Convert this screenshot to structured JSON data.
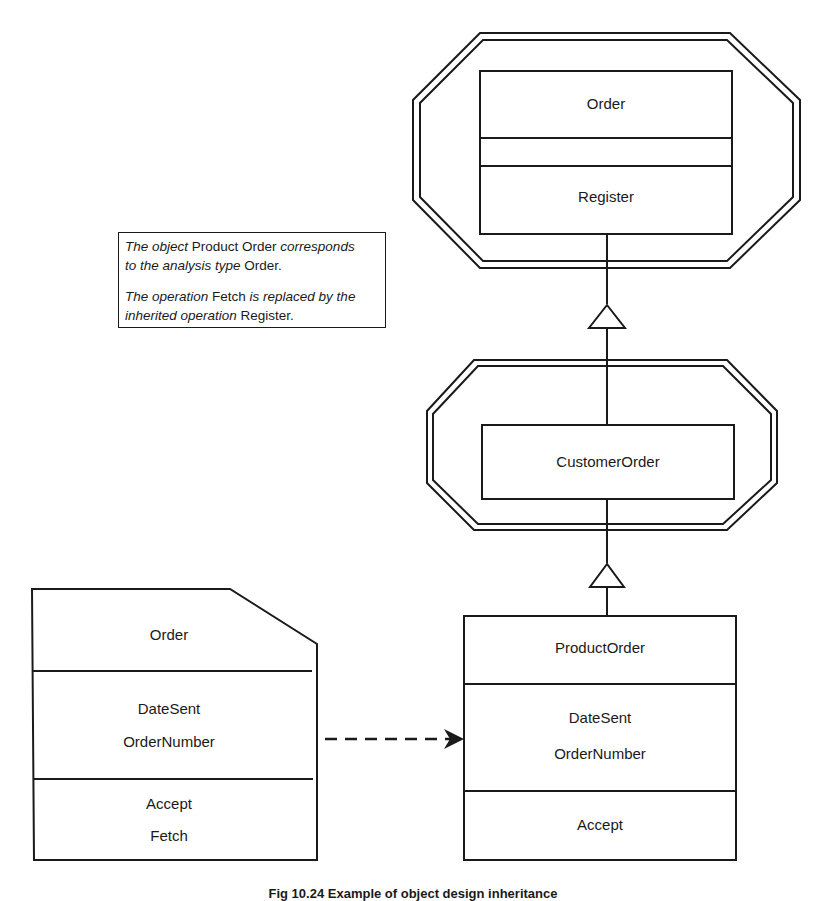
{
  "diagram": {
    "top_class": {
      "name": "Order",
      "attributes": [],
      "operations": [
        "Register"
      ],
      "enclosure": "double-octagon"
    },
    "middle_class": {
      "name": "CustomerOrder",
      "enclosure": "double-octagon"
    },
    "product_class": {
      "name": "ProductOrder",
      "attributes": [
        "DateSent",
        "OrderNumber"
      ],
      "operations": [
        "Accept"
      ]
    },
    "analysis_type": {
      "name": "Order",
      "attributes": [
        "DateSent",
        "OrderNumber"
      ],
      "operations": [
        "Accept",
        "Fetch"
      ],
      "shape": "clipped-corner-box"
    },
    "note": {
      "line1_a": "The object",
      "line1_b": " Product Order ",
      "line1_c": "corresponds",
      "line2_a": "to the analysis type",
      "line2_b": " Order.",
      "line3_a": "The operation",
      "line3_b": " Fetch ",
      "line3_c": "is replaced by the",
      "line4_a": "inherited operation",
      "line4_b": " Register."
    },
    "relations": [
      {
        "from": "CustomerOrder",
        "to": "Order",
        "type": "generalization"
      },
      {
        "from": "ProductOrder",
        "to": "CustomerOrder",
        "type": "generalization"
      },
      {
        "from": "analysis Order",
        "to": "ProductOrder",
        "type": "dashed-dependency"
      }
    ]
  },
  "caption": "Fig 10.24 Example of object design inheritance"
}
